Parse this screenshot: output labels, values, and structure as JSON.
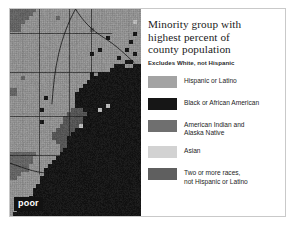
{
  "figure": {
    "title_lines": [
      "Minority group with",
      "highest percent of",
      "county population"
    ],
    "subtitle": "Excludes White, not Hispanic",
    "map_badge": "poor"
  },
  "legend": {
    "items": [
      {
        "label_lines": [
          "Hispanic or Latino"
        ],
        "color": "#a3a3a3",
        "swatch_name": "legend-swatch-hispanic-or-latino"
      },
      {
        "label_lines": [
          "Black or African American"
        ],
        "color": "#161616",
        "swatch_name": "legend-swatch-black-or-african-american"
      },
      {
        "label_lines": [
          "American Indian and",
          "Alaska Native"
        ],
        "color": "#6f6f6f",
        "swatch_name": "legend-swatch-american-indian-and-alaska-native"
      },
      {
        "label_lines": [
          "Asian"
        ],
        "color": "#d2d2d2",
        "swatch_name": "legend-swatch-asian"
      },
      {
        "label_lines": [
          "Two or more races,",
          "not Hispanic or Latino"
        ],
        "color": "#5f5f5f",
        "swatch_name": "legend-swatch-two-or-more-races"
      }
    ]
  },
  "chart_data": {
    "type": "heatmap",
    "title": "Minority group with highest percent of county population",
    "subtitle": "Excludes White, not Hispanic",
    "xlabel": "",
    "ylabel": "",
    "legend_position": "right",
    "grid": false,
    "categories": [
      "Hispanic or Latino",
      "Black or African American",
      "American Indian and Alaska Native",
      "Asian",
      "Two or more races, not Hispanic or Latino"
    ],
    "category_colors": [
      "#a3a3a3",
      "#161616",
      "#6f6f6f",
      "#d2d2d2",
      "#5f5f5f"
    ],
    "region_counts": {
      "Hispanic or Latino": 420,
      "Black or African American": 310,
      "American Indian and Alaska Native": 95,
      "Asian": 40,
      "Two or more races, not Hispanic or Latino": 55
    },
    "map_grid": {
      "cols": 34,
      "rows": 52,
      "value_legend": {
        "1": "Hispanic or Latino",
        "2": "Black or African American",
        "3": "American Indian and Alaska Native",
        "4": "Asian",
        "5": "Two or more races, not Hispanic or Latino",
        "0": "outside map extent"
      },
      "rows_data": [
        "3333333111111111111111111111111111",
        "3333331111111111111111111111111111",
        "3333311111113111111111111111111111",
        "3333111111111111111111111111111141",
        "3331111111111111111111111111111111",
        "3331111111111111111113111111111111",
        "1111111111111111111111111111111121",
        "1111111111111111111111111211111111",
        "1111111111111111111111111111111211",
        "1111111111111111111111111111111111",
        "1111111111111111111111121111112111",
        "1111111111111111111112111111111121",
        "1111111111111111111111111111211111",
        "1111111111111111111111111111112211",
        "1111111111111111111111111112221122",
        "1111111111111111111111111122222222",
        "1111111111111111111112122222222222",
        "1113111111111111111112222222222222",
        "1111111111111111111122222222222222",
        "1111111111111111111222222222222222",
        "3311111111111111112222222222222222",
        "3311111111111111122222222222222222",
        "1111111112111111122222222222222222",
        "1111111111111111122222222222222222",
        "1111111111111111122222222422222222",
        "1111111121111111555222242222222222",
        "1111111111111115555522222222222222",
        "1111111111111155555222222222222222",
        "1111111121111155555222222222222222",
        "1111111111111555554222222222222222",
        "1111111111115555522222222222222222",
        "1111111111155555222222222222222222",
        "1111111111155552222222222222222222",
        "1111111111115552222222222222222222",
        "1111111111111552222222222222222222",
        "1111111111111522222222222222222222",
        "3333333111111222222222222222222222",
        "3333331111112222222222222222222222",
        "3333331111122222222222222222222222",
        "3333311111222222222222222222222222",
        "3333311112222222222222222222222222",
        "3331111112222222222222222222222222",
        "3311111122222222222222222222222222",
        "1111111122222222222222222222222222",
        "1111111222222222222222222222222222",
        "1111112222222222222222222222222222",
        "1111112222222222222222222222222222",
        "1111122222222222222222222222222222",
        "1111222222222222222222222222222222",
        "1112222222222222222222222222222222",
        "1122222222222222222222222222222222",
        "1222222222222222222222222222222222"
      ]
    }
  }
}
